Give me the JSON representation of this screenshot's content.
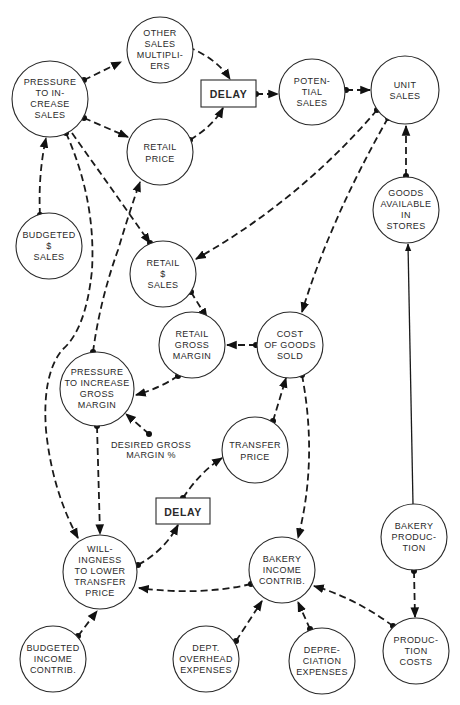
{
  "diagram": {
    "type": "causal-loop influence diagram",
    "nodes": [
      {
        "id": "other_sales_multipliers",
        "lines": [
          "OTHER",
          "SALES",
          "MULTIPLI-",
          "ERS"
        ]
      },
      {
        "id": "pressure_increase_sales",
        "lines": [
          "PRESSURE",
          "TO IN-",
          "CREASE",
          "SALES"
        ]
      },
      {
        "id": "potential_sales",
        "lines": [
          "POTEN-",
          "TIAL",
          "SALES"
        ]
      },
      {
        "id": "unit_sales",
        "lines": [
          "UNIT",
          "SALES"
        ]
      },
      {
        "id": "retail_price",
        "lines": [
          "RETAIL",
          "PRICE"
        ]
      },
      {
        "id": "budgeted_sales",
        "lines": [
          "BUDGETED",
          "$",
          "SALES"
        ]
      },
      {
        "id": "goods_available",
        "lines": [
          "GOODS",
          "AVAILABLE",
          "IN",
          "STORES"
        ]
      },
      {
        "id": "retail_sales",
        "lines": [
          "RETAIL",
          "$",
          "SALES"
        ]
      },
      {
        "id": "retail_gross_margin",
        "lines": [
          "RETAIL",
          "GROSS",
          "MARGIN"
        ]
      },
      {
        "id": "cost_of_goods_sold",
        "lines": [
          "COST",
          "OF GOODS",
          "SOLD"
        ]
      },
      {
        "id": "pressure_gross_margin",
        "lines": [
          "PRESSURE",
          "TO INCREASE",
          "GROSS",
          "MARGIN"
        ]
      },
      {
        "id": "transfer_price",
        "lines": [
          "TRANSFER",
          "PRICE"
        ]
      },
      {
        "id": "willingness_lower_tp",
        "lines": [
          "WILL-",
          "INGNESS",
          "TO LOWER",
          "TRANSFER",
          "PRICE"
        ]
      },
      {
        "id": "bakery_income_contrib",
        "lines": [
          "BAKERY",
          "INCOME",
          "CONTRIB."
        ]
      },
      {
        "id": "bakery_production",
        "lines": [
          "BAKERY",
          "PRODUC-",
          "TION"
        ]
      },
      {
        "id": "budgeted_income_contrib",
        "lines": [
          "BUDGETED",
          "INCOME",
          "CONTRIB."
        ]
      },
      {
        "id": "dept_overhead",
        "lines": [
          "DEPT.",
          "OVERHEAD",
          "EXPENSES"
        ]
      },
      {
        "id": "depreciation",
        "lines": [
          "DEPRE-",
          "CIATION",
          "EXPENSES"
        ]
      },
      {
        "id": "production_costs",
        "lines": [
          "PRODUC-",
          "TION",
          "COSTS"
        ]
      }
    ],
    "delays": [
      {
        "id": "delay_top",
        "label": "DELAY"
      },
      {
        "id": "delay_bottom",
        "label": "DELAY"
      }
    ],
    "free_labels": [
      {
        "id": "desired_gross_margin",
        "lines": [
          "DESIRED GROSS",
          "MARGIN %"
        ]
      }
    ],
    "edges": [
      {
        "from": "pressure_increase_sales",
        "to": "other_sales_multipliers",
        "style": "dashed"
      },
      {
        "from": "other_sales_multipliers",
        "to": "delay_top",
        "style": "dashed"
      },
      {
        "from": "retail_price",
        "to": "delay_top",
        "style": "dashed"
      },
      {
        "from": "delay_top",
        "to": "potential_sales",
        "style": "dashed"
      },
      {
        "from": "potential_sales",
        "to": "unit_sales",
        "style": "dashed"
      },
      {
        "from": "pressure_increase_sales",
        "to": "retail_price",
        "style": "dashed"
      },
      {
        "from": "budgeted_sales",
        "to": "pressure_increase_sales",
        "style": "dashed"
      },
      {
        "from": "pressure_increase_sales",
        "to": "retail_sales",
        "style": "dashed"
      },
      {
        "from": "pressure_increase_sales",
        "to": "willingness_lower_tp",
        "style": "dashed"
      },
      {
        "from": "pressure_gross_margin",
        "to": "retail_price",
        "style": "dashed"
      },
      {
        "from": "unit_sales",
        "to": "retail_sales",
        "style": "dashed"
      },
      {
        "from": "unit_sales",
        "to": "cost_of_goods_sold",
        "style": "dashed"
      },
      {
        "from": "goods_available",
        "to": "unit_sales",
        "style": "dashed"
      },
      {
        "from": "bakery_production",
        "to": "goods_available",
        "style": "solid"
      },
      {
        "from": "retail_sales",
        "to": "retail_gross_margin",
        "style": "dashed"
      },
      {
        "from": "cost_of_goods_sold",
        "to": "retail_gross_margin",
        "style": "dashed"
      },
      {
        "from": "retail_gross_margin",
        "to": "pressure_gross_margin",
        "style": "dashed"
      },
      {
        "from": "desired_gross_margin",
        "to": "pressure_gross_margin",
        "style": "dashed"
      },
      {
        "from": "transfer_price",
        "to": "cost_of_goods_sold",
        "style": "dashed"
      },
      {
        "from": "cost_of_goods_sold",
        "to": "bakery_income_contrib",
        "style": "dashed"
      },
      {
        "from": "pressure_gross_margin",
        "to": "willingness_lower_tp",
        "style": "dashed"
      },
      {
        "from": "delay_bottom",
        "to": "transfer_price",
        "style": "dashed"
      },
      {
        "from": "willingness_lower_tp",
        "to": "delay_bottom",
        "style": "dashed"
      },
      {
        "from": "bakery_income_contrib",
        "to": "willingness_lower_tp",
        "style": "dashed"
      },
      {
        "from": "budgeted_income_contrib",
        "to": "willingness_lower_tp",
        "style": "dashed"
      },
      {
        "from": "dept_overhead",
        "to": "bakery_income_contrib",
        "style": "dashed"
      },
      {
        "from": "depreciation",
        "to": "bakery_income_contrib",
        "style": "dashed"
      },
      {
        "from": "production_costs",
        "to": "bakery_income_contrib",
        "style": "dashed"
      },
      {
        "from": "bakery_production",
        "to": "production_costs",
        "style": "dashed"
      }
    ]
  }
}
